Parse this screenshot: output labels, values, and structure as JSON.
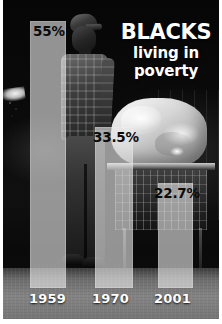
{
  "headline": {
    "main": "BLACKS",
    "line2": "living in",
    "line3": "poverty"
  },
  "chart_data": {
    "type": "bar",
    "title": "BLACKS living in poverty",
    "subtitle": "",
    "xlabel": "",
    "ylabel": "",
    "categories": [
      "1959",
      "1970",
      "2001"
    ],
    "values": [
      55,
      33.5,
      22.7
    ],
    "value_labels": [
      "55%",
      "33.5%",
      "22.7%"
    ],
    "ylim": [
      0,
      55
    ],
    "grid": false,
    "legend": "none",
    "units": "percent",
    "bar_color": "#e8e8e8",
    "label_color": "#0b0b0b",
    "year_label_color": "#ffffff"
  },
  "bars": [
    {
      "year": "1959",
      "label": "55%",
      "value": 55
    },
    {
      "year": "1970",
      "label": "33.5%",
      "value": 33.5
    },
    {
      "year": "2001",
      "label": "22.7%",
      "value": 22.7
    }
  ],
  "scene": {
    "description": "night photograph of a man standing beside a shopping cart loaded with a large white bundle",
    "background_color": "#0a0a0a",
    "floor_color": "#7c7c7c",
    "frame_color": "#ffffff"
  }
}
